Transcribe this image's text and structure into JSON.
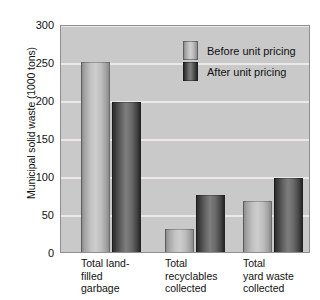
{
  "chart_data": {
    "type": "bar",
    "title": "",
    "xlabel": "",
    "ylabel": "Municipal solid waste (1000 tons)",
    "ylim": [
      0,
      300
    ],
    "yticks": [
      0,
      50,
      100,
      150,
      200,
      250,
      300
    ],
    "ytick_labels": [
      "0",
      "50",
      "100",
      "150",
      "200",
      "250",
      "300"
    ],
    "grid": true,
    "legend_position": "top-right inside plot",
    "categories": [
      "Total land-filled garbage",
      "Total recyclables collected",
      "Total yard waste collected"
    ],
    "category_lines": [
      [
        "Total land-",
        "filled",
        "garbage"
      ],
      [
        "Total",
        "recyclables",
        "collected"
      ],
      [
        "Total",
        "yard waste",
        "collected"
      ]
    ],
    "series": [
      {
        "name": "Before unit pricing",
        "color": "#c2c2c2",
        "values": [
          250,
          30,
          67
        ]
      },
      {
        "name": "After unit pricing",
        "color": "#4a4a4a",
        "values": [
          197,
          75,
          98
        ]
      }
    ]
  },
  "colors": {
    "plot_background": "#c9c9c9",
    "gridline": "#eceaea",
    "axis": "#8f8f8f",
    "text": "#111111",
    "page_background": "#ffffff"
  }
}
